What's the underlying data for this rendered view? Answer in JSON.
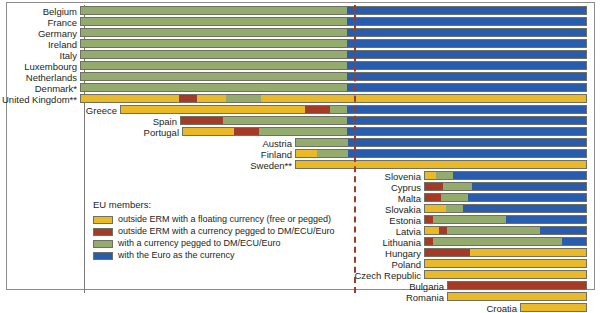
{
  "chart_data": {
    "type": "bar",
    "title": "",
    "xlabel": "",
    "ylabel": "",
    "orientation": "horizontal-stacked-timeline",
    "grid": false,
    "legend_position": "inside-bottom-left",
    "euro_introduction_marker": true,
    "categories": [
      "Belgium",
      "France",
      "Germany",
      "Ireland",
      "Italy",
      "Luxembourg",
      "Netherlands",
      "Denmark*",
      "United Kingdom**",
      "Greece",
      "Spain",
      "Portugal",
      "Austria",
      "Finland",
      "Sweden**",
      "Slovenia",
      "Cyprus",
      "Malta",
      "Slovakia",
      "Estonia",
      "Latvia",
      "Lithuania",
      "Hungary",
      "Poland",
      "Czech Republic",
      "Bulgaria",
      "Romania",
      "Croatia"
    ],
    "series": [
      {
        "name": "outside ERM with a floating currency (free or pegged)",
        "color": "#e9b927",
        "key": "yellow"
      },
      {
        "name": "outside ERM with a currency pegged to DM/ECU/Euro",
        "color": "#a43b27",
        "key": "red"
      },
      {
        "name": "with a currency pegged to DM/ECU/Euro",
        "color": "#93ab6d",
        "key": "green"
      },
      {
        "name": "with the Euro as the currency",
        "color": "#2a5cae",
        "key": "blue"
      }
    ],
    "rows": [
      {
        "label": "Belgium",
        "top": 5,
        "start": 80,
        "segments": [
          {
            "key": "green",
            "width": 267
          },
          {
            "key": "blue",
            "width": 240
          }
        ]
      },
      {
        "label": "France",
        "top": 16,
        "start": 80,
        "segments": [
          {
            "key": "green",
            "width": 267
          },
          {
            "key": "blue",
            "width": 240
          }
        ]
      },
      {
        "label": "Germany",
        "top": 27,
        "start": 80,
        "segments": [
          {
            "key": "green",
            "width": 267
          },
          {
            "key": "blue",
            "width": 240
          }
        ]
      },
      {
        "label": "Ireland",
        "top": 38,
        "start": 80,
        "segments": [
          {
            "key": "green",
            "width": 267
          },
          {
            "key": "blue",
            "width": 240
          }
        ]
      },
      {
        "label": "Italy",
        "top": 49,
        "start": 80,
        "segments": [
          {
            "key": "green",
            "width": 267
          },
          {
            "key": "blue",
            "width": 240
          }
        ]
      },
      {
        "label": "Luxembourg",
        "top": 60,
        "start": 80,
        "segments": [
          {
            "key": "green",
            "width": 267
          },
          {
            "key": "blue",
            "width": 240
          }
        ]
      },
      {
        "label": "Netherlands",
        "top": 71,
        "start": 80,
        "segments": [
          {
            "key": "green",
            "width": 267
          },
          {
            "key": "blue",
            "width": 240
          }
        ]
      },
      {
        "label": "Denmark*",
        "top": 82,
        "start": 80,
        "segments": [
          {
            "key": "green",
            "width": 267
          },
          {
            "key": "blue",
            "width": 240
          }
        ]
      },
      {
        "label": "United Kingdom**",
        "top": 93,
        "start": 80,
        "segments": [
          {
            "key": "yellow",
            "width": 98
          },
          {
            "key": "red",
            "width": 18
          },
          {
            "key": "yellow",
            "width": 30
          },
          {
            "key": "green",
            "width": 35
          },
          {
            "key": "yellow",
            "width": 86
          },
          {
            "key": "yellow",
            "width": 240
          }
        ]
      },
      {
        "label": "Greece",
        "top": 104,
        "start": 120,
        "segments": [
          {
            "key": "yellow",
            "width": 185
          },
          {
            "key": "red",
            "width": 25
          },
          {
            "key": "green",
            "width": 17
          },
          {
            "key": "blue",
            "width": 240
          }
        ]
      },
      {
        "label": "Spain",
        "top": 115,
        "start": 180,
        "segments": [
          {
            "key": "red",
            "width": 42
          },
          {
            "key": "green",
            "width": 125
          },
          {
            "key": "blue",
            "width": 240
          }
        ]
      },
      {
        "label": "Portugal",
        "top": 126,
        "start": 182,
        "segments": [
          {
            "key": "yellow",
            "width": 51
          },
          {
            "key": "red",
            "width": 25
          },
          {
            "key": "green",
            "width": 89
          },
          {
            "key": "blue",
            "width": 240
          }
        ]
      },
      {
        "label": "Austria",
        "top": 137,
        "start": 295,
        "segments": [
          {
            "key": "green",
            "width": 52
          },
          {
            "key": "blue",
            "width": 240
          }
        ]
      },
      {
        "label": "Finland",
        "top": 148,
        "start": 295,
        "segments": [
          {
            "key": "yellow",
            "width": 21
          },
          {
            "key": "green",
            "width": 31
          },
          {
            "key": "blue",
            "width": 240
          }
        ]
      },
      {
        "label": "Sweden**",
        "top": 159,
        "start": 295,
        "segments": [
          {
            "key": "yellow",
            "width": 292
          }
        ]
      },
      {
        "label": "Slovenia",
        "top": 170,
        "start": 424,
        "segments": [
          {
            "key": "yellow",
            "width": 11
          },
          {
            "key": "green",
            "width": 17
          },
          {
            "key": "blue",
            "width": 135
          }
        ]
      },
      {
        "label": "Cyprus",
        "top": 181,
        "start": 424,
        "segments": [
          {
            "key": "red",
            "width": 18
          },
          {
            "key": "green",
            "width": 30
          },
          {
            "key": "blue",
            "width": 115
          }
        ]
      },
      {
        "label": "Malta",
        "top": 192,
        "start": 424,
        "segments": [
          {
            "key": "red",
            "width": 16
          },
          {
            "key": "green",
            "width": 28
          },
          {
            "key": "blue",
            "width": 119
          }
        ]
      },
      {
        "label": "Slovakia",
        "top": 203,
        "start": 424,
        "segments": [
          {
            "key": "yellow",
            "width": 21
          },
          {
            "key": "green",
            "width": 17
          },
          {
            "key": "blue",
            "width": 125
          }
        ]
      },
      {
        "label": "Estonia",
        "top": 214,
        "start": 424,
        "segments": [
          {
            "key": "red",
            "width": 8
          },
          {
            "key": "green",
            "width": 74
          },
          {
            "key": "blue",
            "width": 81
          }
        ]
      },
      {
        "label": "Latvia",
        "top": 225,
        "start": 424,
        "segments": [
          {
            "key": "yellow",
            "width": 14
          },
          {
            "key": "red",
            "width": 8
          },
          {
            "key": "green",
            "width": 94
          },
          {
            "key": "blue",
            "width": 47
          }
        ]
      },
      {
        "label": "Lithuania",
        "top": 236,
        "start": 424,
        "segments": [
          {
            "key": "red",
            "width": 8
          },
          {
            "key": "green",
            "width": 131
          },
          {
            "key": "blue",
            "width": 24
          }
        ]
      },
      {
        "label": "Hungary",
        "top": 247,
        "start": 424,
        "segments": [
          {
            "key": "red",
            "width": 46
          },
          {
            "key": "yellow",
            "width": 117
          }
        ]
      },
      {
        "label": "Poland",
        "top": 258,
        "start": 424,
        "segments": [
          {
            "key": "yellow",
            "width": 163
          }
        ]
      },
      {
        "label": "Czech Republic",
        "top": 269,
        "start": 424,
        "segments": [
          {
            "key": "yellow",
            "width": 163
          }
        ]
      },
      {
        "label": "Bulgaria",
        "top": 280,
        "start": 447,
        "segments": [
          {
            "key": "red",
            "width": 140
          }
        ]
      },
      {
        "label": "Romania",
        "top": 291,
        "start": 447,
        "segments": [
          {
            "key": "yellow",
            "width": 140
          }
        ]
      },
      {
        "label": "Croatia",
        "top": 302,
        "start": 520,
        "segments": [
          {
            "key": "yellow",
            "width": 67
          }
        ]
      }
    ]
  },
  "legend": {
    "title": "EU members:",
    "items": [
      {
        "label": "outside ERM with a floating currency (free or pegged)",
        "color": "#e9b927",
        "icon": "legend-swatch-yellow"
      },
      {
        "label": "outside ERM with a currency pegged to DM/ECU/Euro",
        "color": "#a43b27",
        "icon": "legend-swatch-red"
      },
      {
        "label": "with a currency pegged to DM/ECU/Euro",
        "color": "#93ab6d",
        "icon": "legend-swatch-green"
      },
      {
        "label": "with the Euro as the currency",
        "color": "#2a5cae",
        "icon": "legend-swatch-blue"
      }
    ]
  }
}
